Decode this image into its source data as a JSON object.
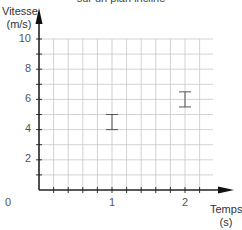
{
  "chart_data": {
    "type": "scatter",
    "title": "sur un plan incliné",
    "xlabel": "Temps (s)",
    "ylabel": "Vitesse (m/s)",
    "xlim": [
      0,
      2.4
    ],
    "ylim": [
      0,
      10
    ],
    "grid": true,
    "x_ticks": [
      "0",
      "1",
      "2"
    ],
    "y_ticks": [
      "2",
      "4",
      "6",
      "8",
      "10"
    ],
    "x_grid_step": 0.2,
    "y_grid_step": 1,
    "series": [
      {
        "name": "mesures",
        "marker": "error-bar",
        "points": [
          {
            "x": 1,
            "y_low": 4.0,
            "y_high": 5.0
          },
          {
            "x": 2,
            "y_low": 5.5,
            "y_high": 6.5
          }
        ]
      }
    ]
  },
  "labels": {
    "title": "sur un plan incliné",
    "ylabel_line1": "Vitesse",
    "ylabel_line2": "(m/s)",
    "xlabel_line1": "Temps",
    "xlabel_line2": "(s)",
    "origin": "0",
    "x1": "1",
    "x2": "2",
    "y2": "2",
    "y4": "4",
    "y6": "6",
    "y8": "8",
    "y10": "10"
  }
}
